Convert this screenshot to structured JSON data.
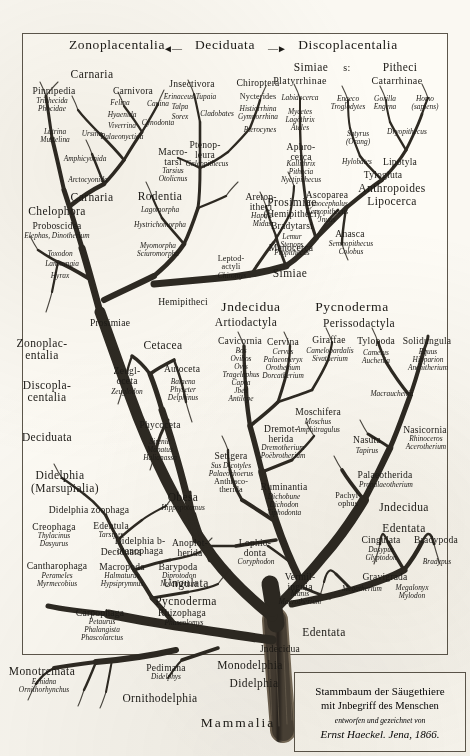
{
  "plate": {
    "title": "Stammbaum der Säugethiere",
    "caption_line2": "mit Jnbegriff des Menschen",
    "caption_line3": "entworfen und gezeichnet von",
    "caption_line4": "Ernst Haeckel. Jena, 1866.",
    "root_label": "Mammalia",
    "ink_color": "#1c1a16",
    "paper_color": "#fdfbf5"
  },
  "top_headers": {
    "left": "Zonoplacentalia",
    "center": "Deciduata",
    "right": "Discoplacentalia",
    "arrow_left": "◄—",
    "arrow_right": "—►"
  },
  "primate_headers": {
    "simiae": "Simiae",
    "sive": "s:",
    "pitheci": "Pitheci",
    "platyrrhinae": "Platyrrhinae",
    "catarrhinae": "Catarrhinae"
  },
  "crown_groups": [
    {
      "name": "Carnaria",
      "x": 92,
      "y": 69,
      "rank": "rank2"
    },
    {
      "name": "Pinnipedia",
      "x": 54,
      "y": 86,
      "rank": "rank3"
    },
    {
      "name": "Carnivora",
      "x": 133,
      "y": 86,
      "rank": "rank3"
    },
    {
      "name": "Jnsectivora",
      "x": 192,
      "y": 79,
      "rank": "rank3"
    },
    {
      "name": "Chiroptera",
      "x": 258,
      "y": 78,
      "rank": "rank3"
    },
    {
      "name": "Nycterides",
      "x": 258,
      "y": 93,
      "rank": "rank4"
    },
    {
      "name": "Ptenopleura",
      "x": 205,
      "y": 140,
      "rank": "rank3",
      "multi": true
    },
    {
      "name": "Macrotarsi",
      "x": 173,
      "y": 147,
      "rank": "rank3",
      "multi": true
    },
    {
      "name": "Aphrocerca",
      "x": 301,
      "y": 142,
      "rank": "rank3",
      "multi": true
    },
    {
      "name": "Aretopitheci",
      "x": 261,
      "y": 192,
      "rank": "rank3",
      "multi": true
    },
    {
      "name": "Ascoparea",
      "x": 327,
      "y": 190,
      "rank": "rank3"
    },
    {
      "name": "Anasca",
      "x": 350,
      "y": 229,
      "rank": "rank3"
    },
    {
      "name": "Menocerca",
      "x": 291,
      "y": 243,
      "rank": "rank3",
      "multi": true
    },
    {
      "name": "Anthropoides",
      "x": 392,
      "y": 183,
      "rank": "rank2"
    },
    {
      "name": "Lipocerca",
      "x": 392,
      "y": 196,
      "rank": "rank2"
    },
    {
      "name": "Lipotyla",
      "x": 400,
      "y": 157,
      "rank": "rank3"
    },
    {
      "name": "Tylogluta",
      "x": 383,
      "y": 170,
      "rank": "rank3"
    },
    {
      "name": "Carnaria",
      "x": 92,
      "y": 192,
      "rank": "rank2"
    },
    {
      "name": "Rodentia",
      "x": 160,
      "y": 191,
      "rank": "rank2"
    },
    {
      "name": "Prosimiae",
      "x": 292,
      "y": 197,
      "rank": "rank2"
    },
    {
      "name": "(Hemipitheci)",
      "x": 292,
      "y": 209,
      "rank": "rank3"
    },
    {
      "name": "Bradytarsi",
      "x": 292,
      "y": 221,
      "rank": "rank3"
    },
    {
      "name": "Chelophora",
      "x": 57,
      "y": 206,
      "rank": "rank2"
    },
    {
      "name": "Proboscidea",
      "x": 57,
      "y": 221,
      "rank": "rank3"
    },
    {
      "name": "Leptodactyli",
      "x": 231,
      "y": 255,
      "rank": "rank4",
      "multi": true
    },
    {
      "name": "Hemipitheci",
      "x": 183,
      "y": 297,
      "rank": "rank3"
    },
    {
      "name": "Simiae",
      "x": 290,
      "y": 268,
      "rank": "rank2"
    },
    {
      "name": "Prosimiae",
      "x": 110,
      "y": 318,
      "rank": "rank3",
      "multi": true
    },
    {
      "name": "Cetacea",
      "x": 163,
      "y": 340,
      "rank": "rank2"
    },
    {
      "name": "Zeugloceta",
      "x": 127,
      "y": 366,
      "rank": "rank3",
      "multi": true
    },
    {
      "name": "Autoceta",
      "x": 182,
      "y": 364,
      "rank": "rank3"
    },
    {
      "name": "Phycoceta",
      "x": 160,
      "y": 420,
      "rank": "rank3",
      "multi": true
    },
    {
      "name": "Obesa",
      "x": 183,
      "y": 492,
      "rank": "rank2"
    },
    {
      "name": "Setigera",
      "x": 231,
      "y": 451,
      "rank": "rank3"
    },
    {
      "name": "Anthracotherida",
      "x": 231,
      "y": 478,
      "rank": "rank4",
      "multi": true
    },
    {
      "name": "Zonoplacentalia",
      "x": 42,
      "y": 338,
      "rank": "rank2",
      "multi": true
    },
    {
      "name": "Discoplacentalia",
      "x": 47,
      "y": 380,
      "rank": "rank2",
      "multi": true
    },
    {
      "name": "Deciduata",
      "x": 47,
      "y": 432,
      "rank": "rank2",
      "multi": true
    },
    {
      "name": "Didelphia",
      "x": 60,
      "y": 470,
      "rank": "rank2"
    },
    {
      "name": "(Marsupialia)",
      "x": 65,
      "y": 483,
      "rank": "rank2"
    },
    {
      "name": "Didelphia zoophaga",
      "x": 89,
      "y": 505,
      "rank": "rank3"
    },
    {
      "name": "Creophaga",
      "x": 54,
      "y": 522,
      "rank": "rank3"
    },
    {
      "name": "Edentula",
      "x": 111,
      "y": 521,
      "rank": "rank3"
    },
    {
      "name": "Deciduata",
      "x": 121,
      "y": 547,
      "rank": "rank3"
    },
    {
      "name": "Didelphia botanophaga",
      "x": 140,
      "y": 536,
      "rank": "rank3",
      "multi": true
    },
    {
      "name": "Cantharophaga",
      "x": 57,
      "y": 561,
      "rank": "rank3"
    },
    {
      "name": "Macropoda",
      "x": 122,
      "y": 562,
      "rank": "rank3"
    },
    {
      "name": "Barypoda",
      "x": 178,
      "y": 562,
      "rank": "rank3"
    },
    {
      "name": "Carpophaga",
      "x": 100,
      "y": 608,
      "rank": "rank3"
    },
    {
      "name": "Rhizophaga",
      "x": 182,
      "y": 608,
      "rank": "rank3"
    },
    {
      "name": "Monotremata",
      "x": 42,
      "y": 666,
      "rank": "rank2"
    },
    {
      "name": "Pedimana",
      "x": 166,
      "y": 663,
      "rank": "rank3"
    },
    {
      "name": "Ornithodelphia",
      "x": 160,
      "y": 693,
      "rank": "rank2"
    },
    {
      "name": "Monodelphia",
      "x": 250,
      "y": 660,
      "rank": "rank2"
    },
    {
      "name": "Didelphia",
      "x": 254,
      "y": 678,
      "rank": "rank2"
    }
  ],
  "right_groups": [
    {
      "name": "Jndecidua",
      "x": 251,
      "y": 300,
      "rank": "rank1"
    },
    {
      "name": "Pycnoderma",
      "x": 352,
      "y": 300,
      "rank": "rank1"
    },
    {
      "name": "Artiodactyla",
      "x": 246,
      "y": 317,
      "rank": "rank2"
    },
    {
      "name": "Perissodactyla",
      "x": 359,
      "y": 318,
      "rank": "rank2"
    },
    {
      "name": "Cavicornia",
      "x": 240,
      "y": 336,
      "rank": "rank3"
    },
    {
      "name": "Cervina",
      "x": 283,
      "y": 337,
      "rank": "rank3"
    },
    {
      "name": "Giraffae",
      "x": 329,
      "y": 335,
      "rank": "rank3"
    },
    {
      "name": "Tylopoda",
      "x": 376,
      "y": 336,
      "rank": "rank3"
    },
    {
      "name": "Solidungula",
      "x": 427,
      "y": 336,
      "rank": "rank3"
    },
    {
      "name": "Moschifera",
      "x": 318,
      "y": 407,
      "rank": "rank3"
    },
    {
      "name": "Dremotherida",
      "x": 281,
      "y": 424,
      "rank": "rank3",
      "multi": true
    },
    {
      "name": "Nasuta",
      "x": 367,
      "y": 435,
      "rank": "rank3"
    },
    {
      "name": "Nasicornia",
      "x": 425,
      "y": 425,
      "rank": "rank3"
    },
    {
      "name": "Palaeotherida",
      "x": 385,
      "y": 470,
      "rank": "rank3"
    },
    {
      "name": "Ruminantia",
      "x": 284,
      "y": 482,
      "rank": "rank3"
    },
    {
      "name": "Pachylophus",
      "x": 348,
      "y": 492,
      "rank": "rank4",
      "multi": true
    },
    {
      "name": "Jndecidua",
      "x": 404,
      "y": 502,
      "rank": "rank2"
    },
    {
      "name": "Edentata",
      "x": 404,
      "y": 523,
      "rank": "rank2"
    },
    {
      "name": "Anoplotherida",
      "x": 190,
      "y": 538,
      "rank": "rank3",
      "multi": true
    },
    {
      "name": "Lophiodonta",
      "x": 255,
      "y": 538,
      "rank": "rank3",
      "multi": true
    },
    {
      "name": "Cingulata",
      "x": 381,
      "y": 535,
      "rank": "rank3"
    },
    {
      "name": "Bradypoda",
      "x": 436,
      "y": 535,
      "rank": "rank3",
      "multi": true
    },
    {
      "name": "Ungulata",
      "x": 186,
      "y": 578,
      "rank": "rank2"
    },
    {
      "name": "Vermilinguia",
      "x": 300,
      "y": 572,
      "rank": "rank3",
      "multi": true
    },
    {
      "name": "Gravigrada",
      "x": 385,
      "y": 572,
      "rank": "rank3"
    },
    {
      "name": "Pycnoderma",
      "x": 186,
      "y": 596,
      "rank": "rank2"
    },
    {
      "name": "Edentata",
      "x": 324,
      "y": 627,
      "rank": "rank2"
    },
    {
      "name": "Jndecidua",
      "x": 280,
      "y": 644,
      "rank": "rank3"
    }
  ],
  "genera": [
    {
      "text": "Trichecida\nPhocidae",
      "x": 52,
      "y": 97
    },
    {
      "text": "Felina",
      "x": 120,
      "y": 99
    },
    {
      "text": "Canina",
      "x": 158,
      "y": 100
    },
    {
      "text": "Hyaenida",
      "x": 122,
      "y": 111
    },
    {
      "text": "Viverrina",
      "x": 122,
      "y": 122
    },
    {
      "text": "Cynodonta",
      "x": 158,
      "y": 119
    },
    {
      "text": "Palaeonyctida",
      "x": 122,
      "y": 133
    },
    {
      "text": "Lutrina\nMustelina",
      "x": 55,
      "y": 128
    },
    {
      "text": "Ursina",
      "x": 92,
      "y": 130
    },
    {
      "text": "Amphicyonida",
      "x": 85,
      "y": 155
    },
    {
      "text": "Arctocyonida",
      "x": 88,
      "y": 176
    },
    {
      "text": "Erinaceus Tupaia",
      "x": 190,
      "y": 93
    },
    {
      "text": "Talpa",
      "x": 180,
      "y": 103
    },
    {
      "text": "Sorex",
      "x": 180,
      "y": 113
    },
    {
      "text": "Cladobates",
      "x": 217,
      "y": 110
    },
    {
      "text": "Histiorrhina\nGymnorrhina",
      "x": 258,
      "y": 105
    },
    {
      "text": "Pterocynes",
      "x": 260,
      "y": 126
    },
    {
      "text": "Galeopithecus",
      "x": 207,
      "y": 160
    },
    {
      "text": "Tarsius\nOtolicnus",
      "x": 173,
      "y": 167
    },
    {
      "text": "Labidocerca",
      "x": 300,
      "y": 94
    },
    {
      "text": "Mycetes\nLagothrix\nAteles",
      "x": 300,
      "y": 108
    },
    {
      "text": "Kallithrix\nPithecia\nNyctipithecus",
      "x": 301,
      "y": 160
    },
    {
      "text": "Engeco\nTroglodytes",
      "x": 348,
      "y": 95
    },
    {
      "text": "Gorilla\nEngena",
      "x": 385,
      "y": 95
    },
    {
      "text": "Homo\n(sapiens)",
      "x": 425,
      "y": 95
    },
    {
      "text": "Satyrus\n(Orang)",
      "x": 358,
      "y": 130
    },
    {
      "text": "Dryopithecus",
      "x": 407,
      "y": 128
    },
    {
      "text": "Hylobates",
      "x": 357,
      "y": 158
    },
    {
      "text": "Hapale\nMidas",
      "x": 262,
      "y": 212
    },
    {
      "text": "Cynocephalus\nCercopithecus\nJnuus",
      "x": 327,
      "y": 200
    },
    {
      "text": "Semnopithecus\nColobus",
      "x": 351,
      "y": 240
    },
    {
      "text": "Lagomorpha",
      "x": 160,
      "y": 206
    },
    {
      "text": "Hystrichomorpha",
      "x": 160,
      "y": 221
    },
    {
      "text": "Myomorpha\nSciuromorpha",
      "x": 158,
      "y": 242
    },
    {
      "text": "Chiromys",
      "x": 232,
      "y": 272
    },
    {
      "text": "Lemur\nStenops\nPropithecus",
      "x": 292,
      "y": 233
    },
    {
      "text": "Elephas, Dinotherium",
      "x": 57,
      "y": 232
    },
    {
      "text": "Toxodon",
      "x": 60,
      "y": 250
    },
    {
      "text": "Lamnungia",
      "x": 62,
      "y": 260
    },
    {
      "text": "Hyrax",
      "x": 60,
      "y": 272
    },
    {
      "text": "Zeuglodon",
      "x": 127,
      "y": 388
    },
    {
      "text": "Balaena\nPhyseter\nDelphinus",
      "x": 183,
      "y": 378
    },
    {
      "text": "Sirenia\nManatus\nHalianassa",
      "x": 160,
      "y": 438
    },
    {
      "text": "Hippopotamus",
      "x": 183,
      "y": 504
    },
    {
      "text": "Sus Dicotyles\nPalaeochoerus",
      "x": 231,
      "y": 462
    },
    {
      "text": "Bos\nOvibos\nOvis\nTragelaphus\nCapra\nJbex\nAntilope",
      "x": 241,
      "y": 347
    },
    {
      "text": "Cervus\nPalaeomeryx\nOrotherium\nDorcatherium",
      "x": 283,
      "y": 348
    },
    {
      "text": "Camelopardalis\nSivatherium",
      "x": 330,
      "y": 347
    },
    {
      "text": "Camelus\nAuchenia",
      "x": 376,
      "y": 349
    },
    {
      "text": "Equus\nHipparion\nAnchitherium",
      "x": 428,
      "y": 348
    },
    {
      "text": "Macrauchenia",
      "x": 392,
      "y": 390
    },
    {
      "text": "Moschus\nAmphitragulus",
      "x": 318,
      "y": 418
    },
    {
      "text": "Dremotherium\nPoëbrotherium",
      "x": 283,
      "y": 444
    },
    {
      "text": "Tapirus",
      "x": 367,
      "y": 447
    },
    {
      "text": "Rhinoceros\nAcerotherium",
      "x": 426,
      "y": 435
    },
    {
      "text": "Propalaeotherium",
      "x": 386,
      "y": 481
    },
    {
      "text": "Dichobune\nDichodon\nXiphodonta",
      "x": 284,
      "y": 493
    },
    {
      "text": "Coryphodon",
      "x": 256,
      "y": 558
    },
    {
      "text": "Dasypus\nGlyptodon",
      "x": 381,
      "y": 546
    },
    {
      "text": "Bradypus",
      "x": 437,
      "y": 558
    },
    {
      "text": "Manis\nMacrotherium",
      "x": 300,
      "y": 590
    },
    {
      "text": "Megatherium",
      "x": 362,
      "y": 585
    },
    {
      "text": "Megalonyx\nMylodon",
      "x": 412,
      "y": 584
    },
    {
      "text": "Thylacinus\nDasyurus",
      "x": 54,
      "y": 532
    },
    {
      "text": "Tarsipes",
      "x": 111,
      "y": 531
    },
    {
      "text": "Perameles\nMyrmecobius",
      "x": 57,
      "y": 572
    },
    {
      "text": "Halmaturus\nHypsiprymnus",
      "x": 122,
      "y": 572
    },
    {
      "text": "Diprotodon\nNotatherium",
      "x": 179,
      "y": 572
    },
    {
      "text": "Petaurus\nPhalangista\nPhascolarctus",
      "x": 102,
      "y": 618
    },
    {
      "text": "Phascolomys",
      "x": 184,
      "y": 619
    },
    {
      "text": "Didelphys",
      "x": 166,
      "y": 673
    },
    {
      "text": "Echidna\nOrnithorhynchus",
      "x": 44,
      "y": 678
    }
  ]
}
